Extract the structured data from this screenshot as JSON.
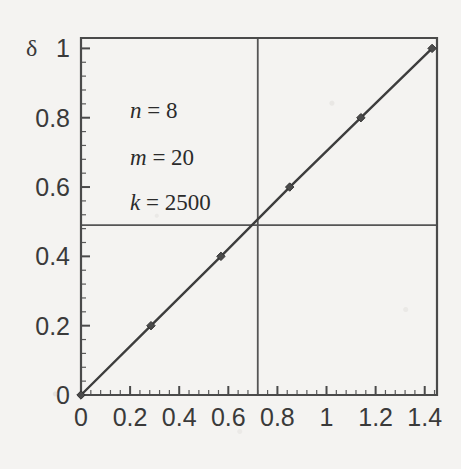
{
  "figure": {
    "background_color": "#f4f3f1",
    "ink_color": "#3d3d3d"
  },
  "annotations": {
    "line1_var": "n",
    "line1_eq": " = ",
    "line1_val": "8",
    "line2_var": "m",
    "line2_eq": " = ",
    "line2_val": "20",
    "line3_var": "k",
    "line3_eq": " = ",
    "line3_val": "2500"
  },
  "axis": {
    "y_symbol": "δ",
    "x_tick_labels": [
      "0",
      "0.2",
      "0.4",
      "0.6",
      "0.8",
      "1",
      "1.2",
      "1.4"
    ],
    "y_tick_labels": [
      "0",
      "0.2",
      "0.4",
      "0.6",
      "0.8",
      "1"
    ]
  },
  "chart_data": {
    "type": "line",
    "title": "",
    "xlabel": "",
    "ylabel": "δ",
    "xlim": [
      0,
      1.45
    ],
    "ylim": [
      0,
      1.03
    ],
    "grid": false,
    "legend": "none",
    "x_ticks": [
      0,
      0.2,
      0.4,
      0.6,
      0.8,
      1,
      1.2,
      1.4
    ],
    "y_ticks": [
      0,
      0.2,
      0.4,
      0.6,
      0.8,
      1
    ],
    "minor_ticks_per_major": 4,
    "series": [
      {
        "name": "delta",
        "marker": "diamond",
        "x": [
          0.0,
          0.285,
          0.57,
          0.85,
          1.14,
          1.43
        ],
        "y": [
          0.0,
          0.2,
          0.4,
          0.6,
          0.8,
          1.0
        ]
      }
    ],
    "reference_lines": [
      {
        "orientation": "vertical",
        "value": 0.72
      },
      {
        "orientation": "horizontal",
        "value": 0.49
      }
    ],
    "annotations": [
      {
        "text": "n = 8",
        "x": 0.28,
        "y": 0.81
      },
      {
        "text": "m = 20",
        "x": 0.28,
        "y": 0.68
      },
      {
        "text": "k = 2500",
        "x": 0.28,
        "y": 0.56
      }
    ]
  }
}
